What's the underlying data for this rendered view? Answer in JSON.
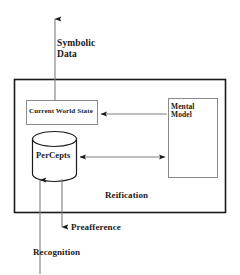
{
  "diagram": {
    "title_visible": false,
    "colors": {
      "stroke": "#1a1a1a",
      "box_stroke": "#8a8a8a",
      "fill": "#ffffff",
      "text": "#1a1a1a"
    },
    "outer_container": {
      "name": "Reification",
      "label": "Reification"
    },
    "nodes": [
      {
        "id": "current-world-state",
        "label": "Current World State",
        "shape": "rectangle"
      },
      {
        "id": "mental-model",
        "label": "Mental\nModel",
        "label_line1": "Mental",
        "label_line2": "Model",
        "shape": "rectangle"
      },
      {
        "id": "percepts",
        "label": "PerCepts",
        "shape": "cylinder"
      }
    ],
    "edge_labels": [
      {
        "id": "symbolic-data",
        "label_line1": "Symbolic",
        "label_line2": "Data",
        "direction": "up",
        "from": "current-world-state",
        "to": "outside-top"
      },
      {
        "id": "preafference",
        "label": "Preafference",
        "direction": "down",
        "from": "percepts",
        "to": "outside-bottom"
      },
      {
        "id": "recognition",
        "label": "Recognition",
        "direction": "up",
        "from": "outside-bottom",
        "to": "percepts"
      }
    ],
    "internal_edges": [
      {
        "id": "mental-model-to-current-world-state",
        "direction": "left",
        "arrowheads": 1
      },
      {
        "id": "percepts-to-mental-model",
        "direction": "bidirectional",
        "arrowheads": 2
      }
    ]
  }
}
